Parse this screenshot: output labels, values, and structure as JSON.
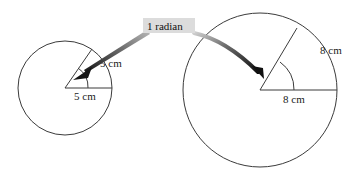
{
  "figure": {
    "background_color": "#ffffff",
    "stroke_color": "#3b3b3b",
    "text_color": "#1a1a1a",
    "callout": {
      "text": "1 radian",
      "background_color": "#dcdcdc",
      "text_color": "#101010"
    },
    "circles": [
      {
        "name": "small-circle",
        "radius_label_slant": "5 cm",
        "radius_label_horizontal": "5 cm",
        "center_x": 65,
        "center_y": 88,
        "radius_px": 47,
        "angle_degrees": 55
      },
      {
        "name": "large-circle",
        "radius_label_slant": "8 cm",
        "radius_label_horizontal": "8 cm",
        "center_x": 260,
        "center_y": 90,
        "radius_px": 77,
        "angle_degrees": 53
      }
    ]
  }
}
